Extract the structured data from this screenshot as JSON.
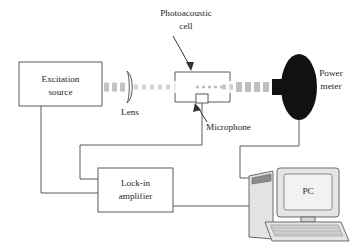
{
  "figure": {
    "background_color": "#ffffff",
    "line_color": "#5a5a5a",
    "beam_color": "#c9c9c9",
    "text_color": "#262626"
  },
  "labels": {
    "photoacoustic_cell_line1": "Photoacoustic",
    "photoacoustic_cell_line2": "cell",
    "excitation_source_line1": "Excitation",
    "excitation_source_line2": "source",
    "lens": "Lens",
    "microphone": "Microphone",
    "power_meter_line1": "Power",
    "power_meter_line2": "meter",
    "lockin_line1": "Lock-in",
    "lockin_line2": "amplifier",
    "pc": "PC"
  },
  "components": [
    {
      "name": "excitation-source",
      "type": "box",
      "label": "Excitation source"
    },
    {
      "name": "lens",
      "type": "plano-convex-lens",
      "label": "Lens"
    },
    {
      "name": "photoacoustic-cell",
      "type": "open-cell",
      "label": "Photoacoustic cell"
    },
    {
      "name": "microphone",
      "type": "small-box",
      "label": "Microphone"
    },
    {
      "name": "power-meter",
      "type": "detector-head",
      "label": "Power meter"
    },
    {
      "name": "lock-in-amplifier",
      "type": "box",
      "label": "Lock-in amplifier"
    },
    {
      "name": "pc",
      "type": "computer",
      "label": "PC"
    }
  ],
  "connections": [
    {
      "name": "excitation-to-lockin",
      "from": "excitation-source",
      "to": "lock-in-amplifier"
    },
    {
      "name": "microphone-to-lockin",
      "from": "microphone",
      "to": "lock-in-amplifier"
    },
    {
      "name": "lockin-to-pc",
      "from": "lock-in-amplifier",
      "to": "pc"
    },
    {
      "name": "power-meter-to-pc",
      "from": "power-meter",
      "to": "pc"
    }
  ],
  "beam": {
    "name": "excitation-beam",
    "style": "dashed",
    "segments": [
      "source-to-lens",
      "lens-to-cell",
      "cell-to-power-meter"
    ]
  },
  "annotations": [
    {
      "name": "cell-arrow",
      "points_to": "photoacoustic-cell"
    },
    {
      "name": "microphone-arrow",
      "points_to": "microphone"
    }
  ]
}
